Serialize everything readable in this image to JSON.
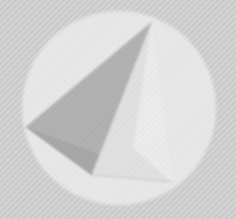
{
  "canvas": {
    "width": 236,
    "height": 219,
    "kind": "logo-watermark",
    "alt_text": "Faded grayscale pyramid logo inside a circle on a textured background"
  },
  "background": {
    "name": "textured-backdrop",
    "base_color": "#c9c9c9",
    "texture": "diagonal-hatch",
    "texture_color": "#d2d2d2",
    "texture_angle_deg": -45,
    "texture_spacing_px": 3
  },
  "circle": {
    "name": "logo-circle",
    "center_x": 119,
    "center_y": 108,
    "radius": 97,
    "fill_color": "#e9e9e9",
    "opacity": 0.92
  },
  "pyramid": {
    "name": "pyramid-mark",
    "apex": {
      "x": 152,
      "y": 22
    },
    "left_vertex": {
      "x": 26,
      "y": 127
    },
    "bottom_vertex": {
      "x": 92,
      "y": 175
    },
    "right_vertex": {
      "x": 172,
      "y": 182
    },
    "faces": [
      {
        "name": "left-face",
        "fill_color": "#a9a9a9",
        "points": "152,22 26,127 92,175"
      },
      {
        "name": "bottom-face",
        "fill_color": "#9d9d9d",
        "points": "26,127 92,175 172,182"
      },
      {
        "name": "right-face",
        "fill_color": "#e0e0e0",
        "points": "152,22 92,175 172,182"
      },
      {
        "name": "right-highlight",
        "fill_color": "#f0f0f0",
        "points": "152,22 130,150 172,182"
      }
    ],
    "edges": [
      {
        "name": "edge-apex-to-left",
        "color": "#b8b8b8"
      },
      {
        "name": "edge-apex-to-bottom",
        "color": "#cfcfcf"
      },
      {
        "name": "edge-left-to-bottom",
        "color": "#8f8f8f"
      },
      {
        "name": "edge-bottom-to-right",
        "color": "#c4c4c4"
      }
    ]
  },
  "labels": {
    "title": "",
    "caption": ""
  }
}
